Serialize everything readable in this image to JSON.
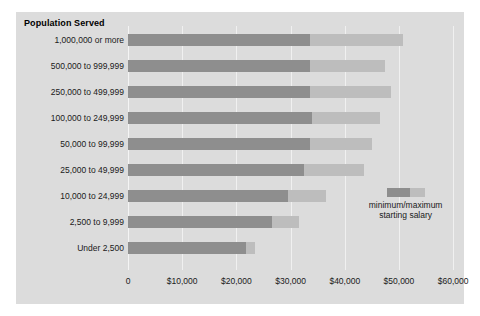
{
  "chart_data": {
    "type": "bar",
    "orientation": "horizontal",
    "title": "Population Served",
    "xlabel": "",
    "ylabel": "Population Served",
    "xlim": [
      0,
      62000
    ],
    "xticks": [
      0,
      10000,
      20000,
      30000,
      40000,
      50000,
      60000
    ],
    "xtick_labels": [
      "0",
      "$10,000",
      "$20,000",
      "$30,000",
      "$40,000",
      "$50,000",
      "$60,000"
    ],
    "grid": true,
    "stacked_range": true,
    "legend": {
      "position": "inside-right",
      "label": "minimum/maximum starting salary",
      "line1": "minimum/maximum",
      "line2": "starting salary",
      "entries": [
        {
          "name": "minimum starting salary",
          "color": "#8e8e8e"
        },
        {
          "name": "maximum starting salary",
          "color": "#bdbdbd"
        }
      ]
    },
    "categories": [
      "1,000,000 or more",
      "500,000 to 999,999",
      "250,000 to 499,999",
      "100,000 to 249,999",
      "50,000 to 99,999",
      "25,000 to 49,999",
      "10,000 to 24,999",
      "2,500 to 9,999",
      "Under 2,500"
    ],
    "series": [
      {
        "name": "minimum starting salary",
        "color": "#8e8e8e",
        "values": [
          33500,
          33500,
          33500,
          34000,
          33500,
          32500,
          29500,
          26500,
          21800
        ]
      },
      {
        "name": "maximum starting salary",
        "color": "#bdbdbd",
        "values": [
          50700,
          47500,
          48500,
          46500,
          45000,
          43500,
          36500,
          31500,
          23500
        ]
      }
    ]
  },
  "colors": {
    "panel_background": "#dcdcdc",
    "page_background": "#ffffff",
    "gridline": "#f0f0f0",
    "bar_min": "#8e8e8e",
    "bar_max": "#bdbdbd",
    "text": "#1a1a1a"
  }
}
